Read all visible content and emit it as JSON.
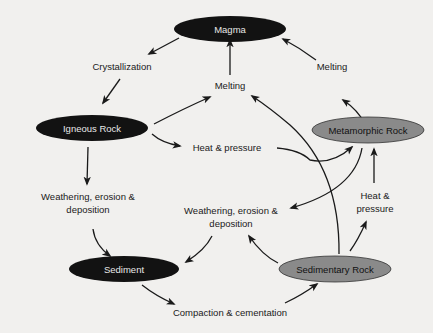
{
  "colors": {
    "background": "#f1f0ee",
    "dark_node": "#121212",
    "gray_node": "#8a8a8a",
    "dark_node_text": "#e8e8e8",
    "gray_node_text": "#111111"
  },
  "nodes": {
    "magma": "Magma",
    "igneous": "Igneous Rock",
    "metamorphic": "Metamorphic Rock",
    "sediment": "Sediment",
    "sedimentary": "Sedimentary Rock"
  },
  "labels": {
    "crystallization": "Crystallization",
    "melting_center": "Melting",
    "melting_right": "Melting",
    "heat_pressure_left": "Heat & pressure",
    "heat_pressure_right_1": "Heat &",
    "heat_pressure_right_2": "pressure",
    "weathering_left_1": "Weathering, erosion &",
    "weathering_left_2": "deposition",
    "weathering_center_1": "Weathering, erosion &",
    "weathering_center_2": "deposition",
    "compaction": "Compaction & cementation"
  }
}
